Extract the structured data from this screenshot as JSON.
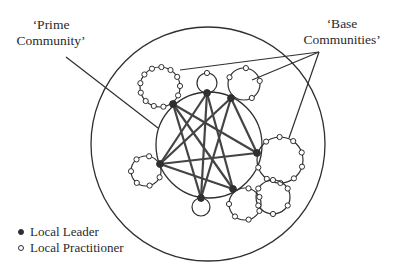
{
  "labels": {
    "prime_line1": "‘Prime",
    "prime_line2": "Community’",
    "base_line1": "‘Base",
    "base_line2": "Communities’"
  },
  "legend": {
    "items": [
      {
        "label": "Local Leader",
        "symbol": "filled-circle"
      },
      {
        "label": "Local Practitioner",
        "symbol": "open-circle"
      }
    ]
  },
  "colors": {
    "stroke": "#2f2f2f",
    "network_edge": "#444444",
    "leader_fill": "#2f2f2f",
    "practitioner_fill": "#ffffff",
    "background": "#ffffff"
  },
  "diagram": {
    "outer_circle": {
      "cx": 208,
      "cy": 144,
      "r": 117
    },
    "prime_circle": {
      "cx": 209,
      "cy": 145,
      "r": 53
    },
    "leaders": [
      {
        "id": "L1",
        "x": 173,
        "y": 104
      },
      {
        "id": "L2",
        "x": 207,
        "y": 93
      },
      {
        "id": "L3",
        "x": 231,
        "y": 98
      },
      {
        "id": "L4",
        "x": 160,
        "y": 164
      },
      {
        "id": "L5",
        "x": 257,
        "y": 153
      },
      {
        "id": "L6",
        "x": 233,
        "y": 189
      },
      {
        "id": "L7",
        "x": 201,
        "y": 198
      }
    ],
    "network_edges": [
      [
        "L1",
        "L5"
      ],
      [
        "L1",
        "L6"
      ],
      [
        "L2",
        "L6"
      ],
      [
        "L2",
        "L7"
      ],
      [
        "L3",
        "L4"
      ],
      [
        "L3",
        "L7"
      ],
      [
        "L3",
        "L5"
      ],
      [
        "L4",
        "L5"
      ],
      [
        "L4",
        "L6"
      ],
      [
        "L1",
        "L7"
      ],
      [
        "L2",
        "L4"
      ]
    ],
    "base_communities": [
      {
        "id": "top-left",
        "cx": 160,
        "cy": 87,
        "r": 20,
        "leader": "L1",
        "practitioners": 12
      },
      {
        "id": "top-center",
        "cx": 207,
        "cy": 83,
        "r": 10,
        "leader": "L2",
        "practitioners": 1
      },
      {
        "id": "top-right",
        "cx": 244,
        "cy": 84,
        "r": 16,
        "leader": "L3",
        "practitioners": 4
      },
      {
        "id": "left",
        "cx": 146,
        "cy": 171,
        "r": 15,
        "leader": "L4",
        "practitioners": 6
      },
      {
        "id": "right",
        "cx": 280,
        "cy": 160,
        "r": 23,
        "leader": "L5",
        "practitioners": 9
      },
      {
        "id": "bottom-right-1",
        "cx": 245,
        "cy": 204,
        "r": 16,
        "leader": "L6",
        "practitioners": 6
      },
      {
        "id": "bottom-right-2",
        "cx": 273,
        "cy": 197,
        "r": 17,
        "leader": null,
        "practitioners": 6
      },
      {
        "id": "bottom",
        "cx": 201,
        "cy": 207,
        "r": 9,
        "leader": "L7",
        "practitioners": 0
      }
    ],
    "pointers": {
      "prime": [
        [
          66,
          57
        ],
        [
          158,
          128
        ]
      ],
      "base_apex": [
        319,
        52
      ],
      "base_targets": [
        [
          180,
          70
        ],
        [
          252,
          80
        ],
        [
          289,
          138
        ]
      ]
    }
  }
}
